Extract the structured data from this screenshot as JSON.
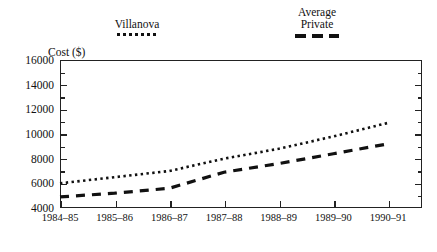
{
  "chart_data": {
    "type": "line",
    "title": "",
    "xlabel": "School Year",
    "ylabel": "Cost ($)",
    "categories": [
      "1984–85",
      "1985–86",
      "1986–87",
      "1987–88",
      "1988–89",
      "1989–90",
      "1990–91"
    ],
    "ylim": [
      4000,
      16000
    ],
    "ytick_labels": [
      "16000",
      "14000",
      "12000",
      "10000",
      "8000",
      "6000",
      "4000"
    ],
    "ytick_values": [
      16000,
      14000,
      12000,
      10000,
      8000,
      6000,
      4000
    ],
    "ytick_step": 2000,
    "yminor_step": 1000,
    "grid": false,
    "legend_position": "above-plot",
    "series": [
      {
        "name": "Villanova",
        "style": "dotted",
        "color": "#111111",
        "values": [
          6000,
          6500,
          7000,
          8000,
          8800,
          9800,
          10900
        ]
      },
      {
        "name": "Average Private",
        "style": "dashed",
        "color": "#111111",
        "values": [
          4900,
          5200,
          5600,
          6900,
          7600,
          8400,
          9200
        ]
      }
    ]
  },
  "legend": {
    "villanova": {
      "label": "Villanova"
    },
    "average_private": {
      "label_line1": "Average",
      "label_line2": "Private"
    }
  },
  "axes": {
    "y_title": "Cost ($)",
    "x_title": "School Year"
  }
}
